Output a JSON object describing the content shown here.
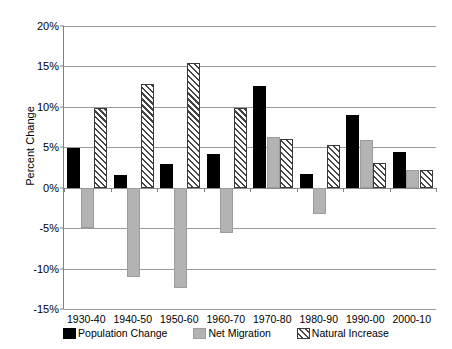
{
  "chart_data": {
    "type": "bar",
    "title": "",
    "subtitle": "",
    "xlabel": "",
    "ylabel": "Percent Change",
    "ylim": [
      -15,
      20
    ],
    "ytick_labels": [
      "20%",
      "15%",
      "10%",
      "5%",
      "0%",
      "-5%",
      "-10%",
      "-15%"
    ],
    "ytick_values": [
      20,
      15,
      10,
      5,
      0,
      -5,
      -10,
      -15
    ],
    "grid": true,
    "legend_position": "bottom",
    "categories": [
      "1930-40",
      "1940-50",
      "1950-60",
      "1960-70",
      "1970-80",
      "1980-90",
      "1990-00",
      "2000-10"
    ],
    "series": [
      {
        "name": "Population Change",
        "color": "#000000",
        "pattern": "solid",
        "values": [
          4.9,
          1.6,
          2.9,
          4.2,
          12.6,
          1.7,
          9.0,
          4.4
        ]
      },
      {
        "name": "Net Migration",
        "color": "#b3b3b3",
        "pattern": "solid",
        "values": [
          -5.0,
          -11.1,
          -12.4,
          -5.6,
          6.3,
          -3.3,
          5.9,
          2.2
        ]
      },
      {
        "name": "Natural Increase",
        "color": "#ffffff",
        "pattern": "diagonal-hatch",
        "values": [
          9.9,
          12.8,
          15.4,
          9.9,
          6.0,
          5.3,
          3.0,
          2.2
        ]
      }
    ]
  },
  "legend": {
    "items": [
      {
        "label": "Population Change"
      },
      {
        "label": "Net Migration"
      },
      {
        "label": "Natural Increase"
      }
    ]
  }
}
